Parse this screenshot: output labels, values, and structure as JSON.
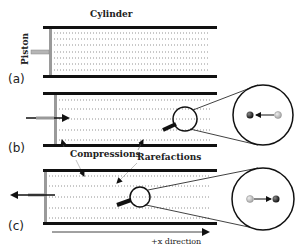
{
  "diagram": {
    "labels": {
      "cylinder": "Cylinder",
      "piston": "Piston",
      "compressions": "Compressions",
      "rarefactions": "Rarefactions",
      "direction": "+x direction"
    },
    "panels": [
      {
        "id": "a",
        "label": "(a)",
        "state": "piston at rest, uniform air"
      },
      {
        "id": "b",
        "label": "(b)",
        "piston_motion": "push right",
        "particle_motion": "left",
        "zoom": "magnified particle displacement"
      },
      {
        "id": "c",
        "label": "(c)",
        "piston_motion": "pull left",
        "particle_motion": "right",
        "zoom": "magnified particle displacement"
      }
    ],
    "colors": {
      "wall": "#111111",
      "piston": "#9a9a9a",
      "dots": "#777777",
      "particle_dark": "#222222",
      "particle_light": "#bdbdbd"
    }
  }
}
